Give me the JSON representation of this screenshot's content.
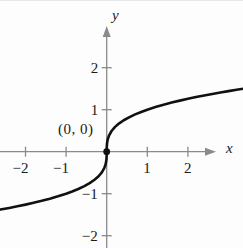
{
  "chart_data": {
    "type": "line",
    "title": "",
    "subtitle": "",
    "xlabel": "x",
    "ylabel": "y",
    "function": "y = cube root of x",
    "xlim": [
      -2.65,
      3.45
    ],
    "ylim": [
      -2.35,
      2.6
    ],
    "grid": false,
    "legend": null,
    "xticks": [
      -2,
      -1,
      1,
      2
    ],
    "yticks": [
      -2,
      -1,
      1,
      2
    ],
    "xtick_labels": [
      "−2",
      "−1",
      "1",
      "2"
    ],
    "ytick_labels": [
      "−2",
      "−1",
      "1",
      "2"
    ],
    "annotations": [
      {
        "text": "(0, 0)",
        "x": 0,
        "y": 0,
        "label_offset_x": -1.15,
        "label_offset_y": 0.62
      }
    ],
    "series": [
      {
        "name": "y = x^(1/3)",
        "color": "#111111",
        "width": 2.6,
        "x": [
          -2.62,
          -2.4,
          -2.2,
          -2.0,
          -1.8,
          -1.6,
          -1.4,
          -1.2,
          -1.0,
          -0.85,
          -0.7,
          -0.55,
          -0.42,
          -0.3,
          -0.2,
          -0.12,
          -0.06,
          -0.025,
          -0.008,
          -0.001,
          0,
          0.001,
          0.008,
          0.025,
          0.06,
          0.12,
          0.2,
          0.3,
          0.42,
          0.55,
          0.7,
          0.85,
          1.0,
          1.2,
          1.4,
          1.6,
          1.8,
          2.0,
          2.2,
          2.4,
          2.6,
          2.8,
          3.0,
          3.2,
          3.42
        ],
        "y": [
          -1.378,
          -1.339,
          -1.301,
          -1.26,
          -1.216,
          -1.17,
          -1.119,
          -1.063,
          -1.0,
          -0.947,
          -0.888,
          -0.819,
          -0.749,
          -0.669,
          -0.585,
          -0.493,
          -0.391,
          -0.292,
          -0.2,
          -0.1,
          0,
          0.1,
          0.2,
          0.292,
          0.391,
          0.493,
          0.585,
          0.669,
          0.749,
          0.819,
          0.888,
          0.947,
          1.0,
          1.063,
          1.119,
          1.17,
          1.216,
          1.26,
          1.301,
          1.339,
          1.375,
          1.409,
          1.442,
          1.474,
          1.507
        ]
      }
    ],
    "markers": [
      {
        "name": "origin-point",
        "x": 0,
        "y": 0,
        "radius": 3.4,
        "color": "#111111"
      }
    ]
  },
  "axes": {
    "x_axis_label": "x",
    "y_axis_label": "y"
  },
  "ticks": {
    "x": [
      {
        "value": -2,
        "label": "−2"
      },
      {
        "value": -1,
        "label": "−1"
      },
      {
        "value": 1,
        "label": "1"
      },
      {
        "value": 2,
        "label": "2"
      }
    ],
    "y": [
      {
        "value": 2,
        "label": "2"
      },
      {
        "value": 1,
        "label": "1"
      },
      {
        "value": -1,
        "label": "−1"
      },
      {
        "value": -2,
        "label": "−2"
      }
    ]
  },
  "labels": {
    "origin_annotation": "(0, 0)"
  },
  "colors": {
    "curve": "#111111",
    "axis": "#8a8a8a",
    "text": "#1a1a1a",
    "background": "#fdfdfd"
  }
}
